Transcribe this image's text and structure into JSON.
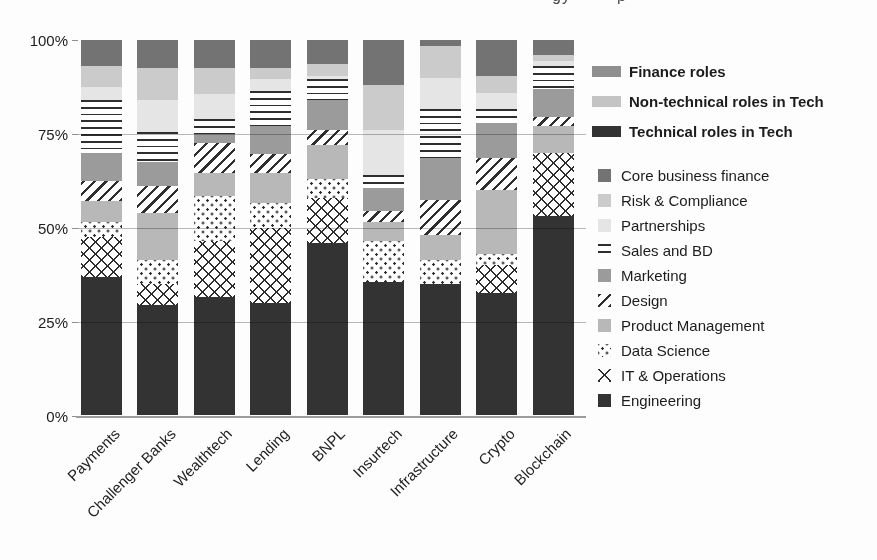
{
  "page": {
    "background": "#fdfdfd"
  },
  "header": {
    "note": "chart title is cropped off at top of screenshot; only descender fragments visible",
    "cropped_title_fragments": [
      "gy",
      "p"
    ]
  },
  "chart_data": {
    "type": "bar",
    "subtype": "stacked-percent-column",
    "title": "",
    "xlabel": "",
    "ylabel": "",
    "ylim": [
      0,
      100
    ],
    "grid": true,
    "legend_position": "right",
    "y_ticks": [
      "0%",
      "25%",
      "50%",
      "75%",
      "100%"
    ],
    "y_tick_values": [
      0,
      25,
      50,
      75,
      100
    ],
    "categories": [
      "Payments",
      "Challenger Banks",
      "Wealthtech",
      "Lending",
      "BNPL",
      "Insurtech",
      "Infrastructure",
      "Crypto",
      "Blockchain"
    ],
    "pattern_ink": "#2e2e2e",
    "pattern_bg": "#ffffff",
    "legend_groups": [
      {
        "label": "Finance roles",
        "color": "#8f8f8f"
      },
      {
        "label": "Non-technical roles in Tech",
        "color": "#c4c4c4"
      },
      {
        "label": "Technical roles in Tech",
        "color": "#333333"
      }
    ],
    "series": [
      {
        "name": "Core business finance",
        "pattern": "solid",
        "color": "#737373",
        "values": [
          7,
          7.5,
          7.5,
          7.5,
          6.5,
          12,
          1.5,
          9.5,
          4
        ]
      },
      {
        "name": "Risk & Compliance",
        "pattern": "solid",
        "color": "#cbcbcb",
        "values": [
          5.5,
          8.5,
          7,
          3,
          3,
          12,
          8.5,
          4.5,
          1.5
        ]
      },
      {
        "name": "Partnerships",
        "pattern": "solid",
        "color": "#e5e5e5",
        "values": [
          3.5,
          8.5,
          6.5,
          3,
          1,
          12,
          8.5,
          4.5,
          1.5
        ]
      },
      {
        "name": "Sales and BD",
        "pattern": "hlines",
        "color": "#2e2e2e",
        "values": [
          14,
          8,
          4,
          9.5,
          5.5,
          3.5,
          13,
          3.5,
          6
        ]
      },
      {
        "name": "Marketing",
        "pattern": "solid",
        "color": "#9b9b9b",
        "values": [
          7.5,
          6.5,
          2.5,
          7.5,
          8,
          6,
          11,
          9.5,
          7.5
        ]
      },
      {
        "name": "Design",
        "pattern": "diag",
        "color": "#2e2e2e",
        "values": [
          5.5,
          7,
          8,
          5,
          4,
          3,
          9.5,
          8.5,
          2.5
        ]
      },
      {
        "name": "Product Management",
        "pattern": "solid",
        "color": "#b8b8b8",
        "values": [
          5.5,
          12.5,
          6,
          8,
          9,
          5,
          6.5,
          17,
          7
        ]
      },
      {
        "name": "Data Science",
        "pattern": "dots",
        "color": "#2e2e2e",
        "values": [
          4,
          6.5,
          12,
          6.5,
          5,
          11,
          6.5,
          3,
          0
        ]
      },
      {
        "name": "IT & Operations",
        "pattern": "cross",
        "color": "#2e2e2e",
        "values": [
          10.5,
          5.5,
          15,
          20,
          12,
          0,
          0,
          7.5,
          17
        ]
      },
      {
        "name": "Engineering",
        "pattern": "solid",
        "color": "#333333",
        "values": [
          37,
          29.5,
          31.5,
          30,
          46,
          35.5,
          35,
          32.5,
          53
        ]
      }
    ]
  }
}
